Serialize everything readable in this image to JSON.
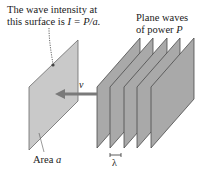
{
  "annotations": {
    "intensity_line1": "The wave intensity at",
    "intensity_line2_prefix": "this surface is ",
    "intensity_formula": "I = P/a.",
    "plane_waves_line1": "Plane waves",
    "plane_waves_line2_prefix": "of power ",
    "plane_waves_power": "P",
    "velocity_label": "v",
    "area_prefix": "Area ",
    "area_symbol": "a",
    "wavelength_label": "λ"
  },
  "colors": {
    "surface_fill": "#c9c9c9",
    "wave_fill": "#a9a9a9",
    "edge": "#555555",
    "arrow": "#7a7a7a"
  },
  "wave_planes": [
    {
      "x_left": 97
    },
    {
      "x_left": 110
    },
    {
      "x_left": 124
    },
    {
      "x_left": 137
    },
    {
      "x_left": 151
    }
  ]
}
